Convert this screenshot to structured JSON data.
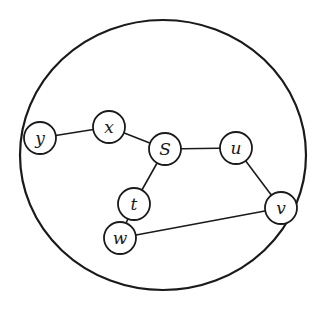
{
  "diagram": {
    "type": "graph",
    "boundary": {
      "shape": "circle",
      "cx": 163,
      "cy": 155,
      "rx": 143,
      "ry": 135
    },
    "nodes": [
      {
        "id": "y",
        "label": "y",
        "x": 40,
        "y": 138
      },
      {
        "id": "x",
        "label": "x",
        "x": 109,
        "y": 127
      },
      {
        "id": "S",
        "label": "S",
        "x": 165,
        "y": 149
      },
      {
        "id": "u",
        "label": "u",
        "x": 236,
        "y": 148
      },
      {
        "id": "t",
        "label": "t",
        "x": 134,
        "y": 204
      },
      {
        "id": "v",
        "label": "v",
        "x": 281,
        "y": 208
      },
      {
        "id": "w",
        "label": "w",
        "x": 120,
        "y": 238
      }
    ],
    "edges": [
      {
        "from": "y",
        "to": "x"
      },
      {
        "from": "x",
        "to": "S"
      },
      {
        "from": "S",
        "to": "u"
      },
      {
        "from": "u",
        "to": "v"
      },
      {
        "from": "S",
        "to": "t"
      },
      {
        "from": "t",
        "to": "w"
      },
      {
        "from": "w",
        "to": "v"
      }
    ],
    "node_radius": 16,
    "stroke_color": "#1a1a1a"
  }
}
